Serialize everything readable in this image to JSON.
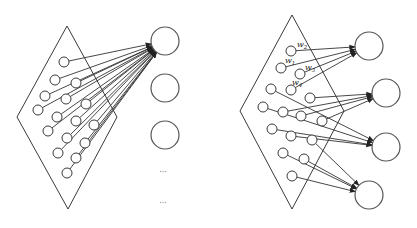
{
  "figure": {
    "left_panel": {
      "name": "fully-connected",
      "plane": [
        [
          67,
          26
        ],
        [
          117,
          117
        ],
        [
          68,
          209
        ],
        [
          17,
          117
        ]
      ],
      "input_nodes": [
        [
          64,
          62
        ],
        [
          55,
          80
        ],
        [
          76,
          83
        ],
        [
          45,
          96
        ],
        [
          66,
          99
        ],
        [
          38,
          110
        ],
        [
          86,
          104
        ],
        [
          57,
          117
        ],
        [
          48,
          131
        ],
        [
          76,
          121
        ],
        [
          67,
          138
        ],
        [
          94,
          125
        ],
        [
          58,
          153
        ],
        [
          85,
          143
        ],
        [
          76,
          158
        ],
        [
          67,
          173
        ]
      ],
      "output_nodes": [
        [
          165,
          41
        ],
        [
          165,
          88
        ],
        [
          165,
          135
        ]
      ],
      "ellipsis": [
        {
          "text": "...",
          "x": 163,
          "y": 172
        },
        {
          "text": "...",
          "x": 163,
          "y": 203
        }
      ],
      "target_output": 0
    },
    "right_panel": {
      "name": "locally-connected",
      "plane": [
        [
          292,
          15
        ],
        [
          344,
          111
        ],
        [
          292,
          209
        ],
        [
          240,
          111
        ]
      ],
      "input_nodes": [
        [
          291,
          51
        ],
        [
          281,
          68
        ],
        [
          300,
          74
        ],
        [
          271,
          89
        ],
        [
          291,
          90
        ],
        [
          310,
          98
        ],
        [
          263,
          107
        ],
        [
          283,
          112
        ],
        [
          301,
          116
        ],
        [
          322,
          121
        ],
        [
          272,
          129
        ],
        [
          291,
          136
        ],
        [
          312,
          140
        ],
        [
          283,
          153
        ],
        [
          304,
          159
        ],
        [
          292,
          176
        ]
      ],
      "output_nodes": [
        [
          369,
          46
        ],
        [
          386,
          93
        ],
        [
          386,
          147
        ],
        [
          369,
          195
        ]
      ],
      "connections": [
        {
          "output": 0,
          "inputs": [
            0,
            1,
            2,
            4
          ]
        },
        {
          "output": 1,
          "inputs": [
            5,
            7,
            8,
            9
          ]
        },
        {
          "output": 2,
          "inputs": [
            3,
            6,
            10,
            11
          ]
        },
        {
          "output": 3,
          "inputs": [
            12,
            13,
            14,
            15
          ]
        }
      ],
      "weight_labels": [
        {
          "base": "w",
          "sub": "2",
          "x": 297,
          "y": 47
        },
        {
          "base": "w",
          "sub": "1",
          "x": 285,
          "y": 63
        },
        {
          "base": "w",
          "sub": "3",
          "x": 305,
          "y": 70
        },
        {
          "base": "w",
          "sub": "4",
          "x": 292,
          "y": 85
        }
      ]
    }
  }
}
